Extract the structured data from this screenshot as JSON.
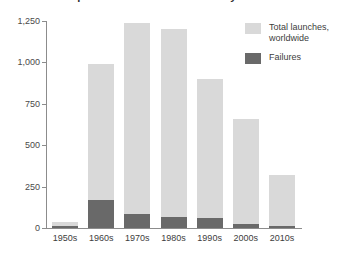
{
  "chart_data": {
    "type": "bar",
    "title": "Space launches and failures by decade",
    "xlabel": "",
    "ylabel": "",
    "ylim": [
      0,
      1250
    ],
    "yticks": [
      0,
      250,
      500,
      750,
      1000,
      1250
    ],
    "ytick_labels": [
      "0",
      "250",
      "500",
      "750",
      "1,000",
      "1,250"
    ],
    "grid": false,
    "stacked": true,
    "legend_position": "top-right",
    "categories": [
      "1950s",
      "1960s",
      "1970s",
      "1980s",
      "1990s",
      "2000s",
      "2010s"
    ],
    "series": [
      {
        "name": "Total launches, worldwide",
        "color": "#d9d9d9",
        "values": [
          36,
          990,
          1240,
          1200,
          900,
          660,
          320
        ]
      },
      {
        "name": "Failures",
        "color": "#696969",
        "values": [
          12,
          170,
          85,
          65,
          60,
          25,
          15
        ]
      }
    ]
  },
  "legend": {
    "items": [
      {
        "label": "Total launches, worldwide",
        "color": "#d9d9d9"
      },
      {
        "label": "Failures",
        "color": "#696969"
      }
    ]
  },
  "axis": {
    "y_labels": [
      "1,250",
      "1,000",
      "750",
      "500",
      "250",
      "0"
    ],
    "x_labels": [
      "1950s",
      "1960s",
      "1970s",
      "1980s",
      "1990s",
      "2000s",
      "2010s"
    ]
  },
  "colors": {
    "total": "#d9d9d9",
    "failures": "#696969",
    "axis": "#8c8c8c",
    "text": "#3d3d3d",
    "background": "#ffffff"
  }
}
